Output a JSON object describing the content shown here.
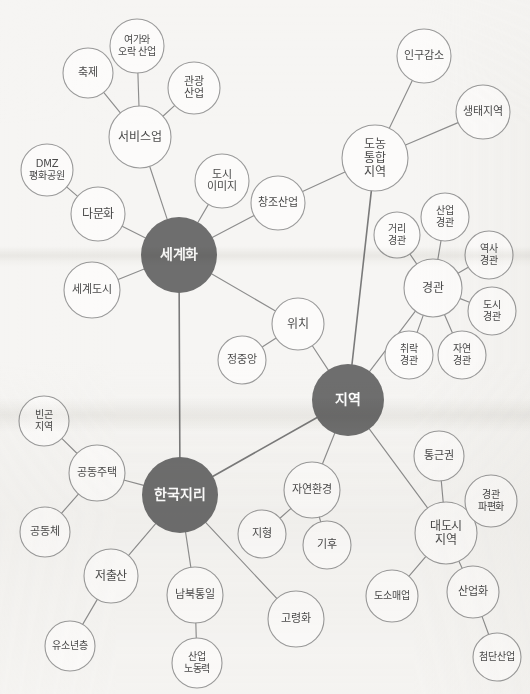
{
  "diagram": {
    "type": "mind-map",
    "background_color": "#f6f5f3",
    "hub_color": "#6e6e6e",
    "node_fill": "#fcfbfa",
    "node_stroke": "#9a9a9a",
    "edge_color": "#8d8d8d",
    "label_color": "#4a4a4a",
    "hub_label_color": "#ffffff"
  },
  "nodes": [
    {
      "id": "segyehwa",
      "label": "세계화",
      "lines": [
        "세계화"
      ],
      "x": 179,
      "y": 255,
      "r": 38,
      "hub": true,
      "font": 14
    },
    {
      "id": "jiyeok",
      "label": "지역",
      "lines": [
        "지역"
      ],
      "x": 348,
      "y": 400,
      "r": 36,
      "hub": true,
      "font": 14
    },
    {
      "id": "hangukjiri",
      "label": "한국지리",
      "lines": [
        "한국지리"
      ],
      "x": 180,
      "y": 495,
      "r": 38,
      "hub": true,
      "font": 14
    },
    {
      "id": "donong",
      "label": "도농통합지역",
      "lines": [
        "도농",
        "통합",
        "지역"
      ],
      "x": 375,
      "y": 158,
      "r": 33,
      "hub": false,
      "font": 12
    },
    {
      "id": "seobiseu",
      "label": "서비스업",
      "lines": [
        "서비스업"
      ],
      "x": 140,
      "y": 137,
      "r": 31,
      "hub": false,
      "font": 12
    },
    {
      "id": "gyeonggwan",
      "label": "경관",
      "lines": [
        "경관"
      ],
      "x": 433,
      "y": 288,
      "r": 29,
      "hub": false,
      "font": 12
    },
    {
      "id": "daedosi",
      "label": "대도시지역",
      "lines": [
        "대도시",
        "지역"
      ],
      "x": 446,
      "y": 533,
      "r": 31,
      "hub": false,
      "font": 12
    },
    {
      "id": "yeogaorak",
      "label": "여가와 오락 산업",
      "lines": [
        "여가와",
        "오락 산업"
      ],
      "x": 137,
      "y": 46,
      "r": 27,
      "hub": false,
      "font": 10
    },
    {
      "id": "chukje",
      "label": "축제",
      "lines": [
        "축제"
      ],
      "x": 88,
      "y": 73,
      "r": 25,
      "hub": false,
      "font": 11
    },
    {
      "id": "gwangwang",
      "label": "관광산업",
      "lines": [
        "관광",
        "산업"
      ],
      "x": 194,
      "y": 88,
      "r": 26,
      "hub": false,
      "font": 11
    },
    {
      "id": "dmz",
      "label": "DMZ 평화공원",
      "lines": [
        "DMZ",
        "평화공원"
      ],
      "x": 47,
      "y": 170,
      "r": 26,
      "hub": false,
      "font": 10
    },
    {
      "id": "damunhwa",
      "label": "다문화",
      "lines": [
        "다문화"
      ],
      "x": 98,
      "y": 214,
      "r": 27,
      "hub": false,
      "font": 12
    },
    {
      "id": "segyedosi",
      "label": "세계도시",
      "lines": [
        "세계도시"
      ],
      "x": 92,
      "y": 290,
      "r": 28,
      "hub": false,
      "font": 11
    },
    {
      "id": "dosiimage",
      "label": "도시이미지",
      "lines": [
        "도시",
        "이미지"
      ],
      "x": 222,
      "y": 181,
      "r": 27,
      "hub": false,
      "font": 11
    },
    {
      "id": "changjo",
      "label": "창조산업",
      "lines": [
        "창조산업"
      ],
      "x": 278,
      "y": 203,
      "r": 27,
      "hub": false,
      "font": 11
    },
    {
      "id": "ingugamso",
      "label": "인구감소",
      "lines": [
        "인구감소"
      ],
      "x": 424,
      "y": 56,
      "r": 27,
      "hub": false,
      "font": 11
    },
    {
      "id": "saengtae",
      "label": "생태지역",
      "lines": [
        "생태지역"
      ],
      "x": 483,
      "y": 112,
      "r": 27,
      "hub": false,
      "font": 11
    },
    {
      "id": "geori",
      "label": "거리경관",
      "lines": [
        "거리",
        "경관"
      ],
      "x": 397,
      "y": 235,
      "r": 23,
      "hub": false,
      "font": 10
    },
    {
      "id": "sanupgg",
      "label": "산업경관",
      "lines": [
        "산업",
        "경관"
      ],
      "x": 445,
      "y": 217,
      "r": 24,
      "hub": false,
      "font": 10
    },
    {
      "id": "yeoksa",
      "label": "역사경관",
      "lines": [
        "역사",
        "경관"
      ],
      "x": 489,
      "y": 255,
      "r": 24,
      "hub": false,
      "font": 10
    },
    {
      "id": "dosigg",
      "label": "도시경관",
      "lines": [
        "도시",
        "경관"
      ],
      "x": 492,
      "y": 311,
      "r": 24,
      "hub": false,
      "font": 10
    },
    {
      "id": "chwirak",
      "label": "취락경관",
      "lines": [
        "취락",
        "경관"
      ],
      "x": 409,
      "y": 355,
      "r": 24,
      "hub": false,
      "font": 10
    },
    {
      "id": "jayeongg",
      "label": "자연경관",
      "lines": [
        "자연",
        "경관"
      ],
      "x": 462,
      "y": 355,
      "r": 24,
      "hub": false,
      "font": 10
    },
    {
      "id": "wichi",
      "label": "위치",
      "lines": [
        "위치"
      ],
      "x": 298,
      "y": 324,
      "r": 26,
      "hub": false,
      "font": 12
    },
    {
      "id": "jeongjungang",
      "label": "정중앙",
      "lines": [
        "정중앙"
      ],
      "x": 242,
      "y": 360,
      "r": 24,
      "hub": false,
      "font": 11
    },
    {
      "id": "bingon",
      "label": "빈곤지역",
      "lines": [
        "빈곤",
        "지역"
      ],
      "x": 44,
      "y": 421,
      "r": 25,
      "hub": false,
      "font": 10
    },
    {
      "id": "gongdongjutaek",
      "label": "공동주택",
      "lines": [
        "공동주택"
      ],
      "x": 97,
      "y": 473,
      "r": 28,
      "hub": false,
      "font": 11
    },
    {
      "id": "gongdongche",
      "label": "공동체",
      "lines": [
        "공동체"
      ],
      "x": 45,
      "y": 532,
      "r": 25,
      "hub": false,
      "font": 11
    },
    {
      "id": "jeochulsan",
      "label": "저출산",
      "lines": [
        "저출산"
      ],
      "x": 111,
      "y": 576,
      "r": 27,
      "hub": false,
      "font": 12
    },
    {
      "id": "yusonyeon",
      "label": "유소년층",
      "lines": [
        "유소년층"
      ],
      "x": 70,
      "y": 646,
      "r": 25,
      "hub": false,
      "font": 10
    },
    {
      "id": "nambuk",
      "label": "남북통일",
      "lines": [
        "남북통일"
      ],
      "x": 195,
      "y": 595,
      "r": 28,
      "hub": false,
      "font": 11
    },
    {
      "id": "sanupnodong",
      "label": "산업노동력",
      "lines": [
        "산업",
        "노동력"
      ],
      "x": 197,
      "y": 663,
      "r": 25,
      "hub": false,
      "font": 10
    },
    {
      "id": "goryeonghwa",
      "label": "고령화",
      "lines": [
        "고령화"
      ],
      "x": 296,
      "y": 619,
      "r": 28,
      "hub": false,
      "font": 11
    },
    {
      "id": "jayeonhwan",
      "label": "자연환경",
      "lines": [
        "자연환경"
      ],
      "x": 312,
      "y": 490,
      "r": 28,
      "hub": false,
      "font": 11
    },
    {
      "id": "jihyeong",
      "label": "지형",
      "lines": [
        "지형"
      ],
      "x": 262,
      "y": 534,
      "r": 24,
      "hub": false,
      "font": 11
    },
    {
      "id": "gihu",
      "label": "기후",
      "lines": [
        "기후"
      ],
      "x": 327,
      "y": 545,
      "r": 24,
      "hub": false,
      "font": 11
    },
    {
      "id": "tonggeun",
      "label": "통근권",
      "lines": [
        "통근권"
      ],
      "x": 439,
      "y": 456,
      "r": 25,
      "hub": false,
      "font": 11
    },
    {
      "id": "gwanpyeon",
      "label": "경관파편화",
      "lines": [
        "경관",
        "파편화"
      ],
      "x": 491,
      "y": 501,
      "r": 26,
      "hub": false,
      "font": 10
    },
    {
      "id": "dosomae",
      "label": "도소매업",
      "lines": [
        "도소매업"
      ],
      "x": 392,
      "y": 596,
      "r": 26,
      "hub": false,
      "font": 10
    },
    {
      "id": "sanuphwa",
      "label": "산업화",
      "lines": [
        "산업화"
      ],
      "x": 473,
      "y": 592,
      "r": 26,
      "hub": false,
      "font": 11
    },
    {
      "id": "cheomdan",
      "label": "첨단산업",
      "lines": [
        "첨단산업"
      ],
      "x": 497,
      "y": 657,
      "r": 24,
      "hub": false,
      "font": 10
    }
  ],
  "edges": [
    {
      "from": "yeogaorak",
      "to": "seobiseu",
      "thick": false
    },
    {
      "from": "chukje",
      "to": "seobiseu",
      "thick": false
    },
    {
      "from": "gwangwang",
      "to": "seobiseu",
      "thick": false
    },
    {
      "from": "seobiseu",
      "to": "segyehwa",
      "thick": false
    },
    {
      "from": "dmz",
      "to": "damunhwa",
      "thick": false
    },
    {
      "from": "damunhwa",
      "to": "segyehwa",
      "thick": false
    },
    {
      "from": "segyedosi",
      "to": "segyehwa",
      "thick": false
    },
    {
      "from": "dosiimage",
      "to": "segyehwa",
      "thick": false
    },
    {
      "from": "changjo",
      "to": "segyehwa",
      "thick": false
    },
    {
      "from": "changjo",
      "to": "donong",
      "thick": false
    },
    {
      "from": "ingugamso",
      "to": "donong",
      "thick": false
    },
    {
      "from": "saengtae",
      "to": "donong",
      "thick": false
    },
    {
      "from": "donong",
      "to": "jiyeok",
      "thick": true
    },
    {
      "from": "segyehwa",
      "to": "wichi",
      "thick": false
    },
    {
      "from": "wichi",
      "to": "jeongjungang",
      "thick": false
    },
    {
      "from": "wichi",
      "to": "jiyeok",
      "thick": false
    },
    {
      "from": "segyehwa",
      "to": "hangukjiri",
      "thick": true
    },
    {
      "from": "geori",
      "to": "gyeonggwan",
      "thick": false
    },
    {
      "from": "sanupgg",
      "to": "gyeonggwan",
      "thick": false
    },
    {
      "from": "yeoksa",
      "to": "gyeonggwan",
      "thick": false
    },
    {
      "from": "dosigg",
      "to": "gyeonggwan",
      "thick": false
    },
    {
      "from": "chwirak",
      "to": "gyeonggwan",
      "thick": false
    },
    {
      "from": "jayeongg",
      "to": "gyeonggwan",
      "thick": false
    },
    {
      "from": "gyeonggwan",
      "to": "jiyeok",
      "thick": false
    },
    {
      "from": "jiyeok",
      "to": "hangukjiri",
      "thick": true
    },
    {
      "from": "jiyeok",
      "to": "jayeonhwan",
      "thick": false
    },
    {
      "from": "jayeonhwan",
      "to": "jihyeong",
      "thick": false
    },
    {
      "from": "jayeonhwan",
      "to": "gihu",
      "thick": false
    },
    {
      "from": "jiyeok",
      "to": "daedosi",
      "thick": false
    },
    {
      "from": "tonggeun",
      "to": "daedosi",
      "thick": false
    },
    {
      "from": "gwanpyeon",
      "to": "daedosi",
      "thick": false
    },
    {
      "from": "dosomae",
      "to": "daedosi",
      "thick": false
    },
    {
      "from": "sanuphwa",
      "to": "daedosi",
      "thick": false
    },
    {
      "from": "sanuphwa",
      "to": "cheomdan",
      "thick": false
    },
    {
      "from": "bingon",
      "to": "gongdongjutaek",
      "thick": false
    },
    {
      "from": "gongdongche",
      "to": "gongdongjutaek",
      "thick": false
    },
    {
      "from": "gongdongjutaek",
      "to": "hangukjiri",
      "thick": false
    },
    {
      "from": "jeochulsan",
      "to": "hangukjiri",
      "thick": false
    },
    {
      "from": "jeochulsan",
      "to": "yusonyeon",
      "thick": false
    },
    {
      "from": "nambuk",
      "to": "hangukjiri",
      "thick": false
    },
    {
      "from": "nambuk",
      "to": "sanupnodong",
      "thick": false
    },
    {
      "from": "goryeonghwa",
      "to": "hangukjiri",
      "thick": false
    }
  ]
}
